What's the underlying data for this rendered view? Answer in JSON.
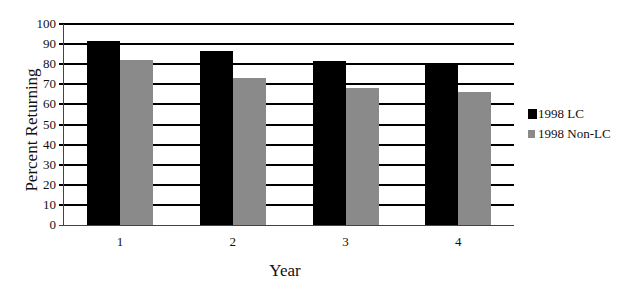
{
  "chart_data": {
    "type": "bar",
    "title": "",
    "xlabel": "Year",
    "ylabel": "Percent Returning",
    "categories": [
      "1",
      "2",
      "3",
      "4"
    ],
    "series": [
      {
        "name": "1998 LC",
        "color": "#000000",
        "values": [
          91.5,
          86.5,
          81.5,
          80.5
        ]
      },
      {
        "name": "1998 Non-LC",
        "color": "#8a8a8a",
        "values": [
          82,
          73,
          68,
          66
        ]
      }
    ],
    "ylim": [
      0,
      100
    ],
    "yticks": [
      0,
      10,
      20,
      30,
      40,
      50,
      60,
      70,
      80,
      90,
      100
    ],
    "grid": true,
    "legend_position": "right"
  }
}
